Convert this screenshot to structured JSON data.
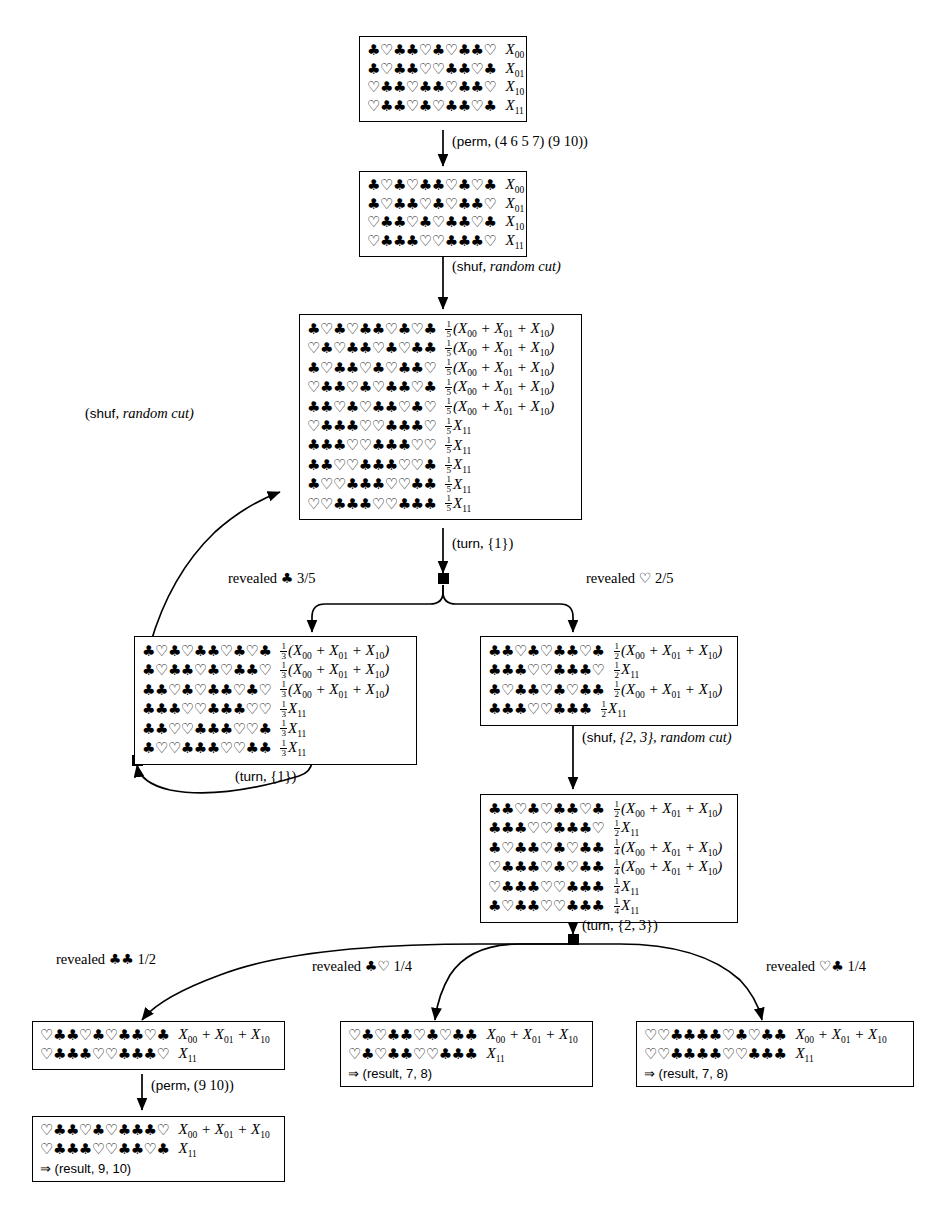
{
  "diagram": {
    "suits": {
      "club": "♣",
      "heart": "♡"
    }
  },
  "boxes": [
    {
      "id": "box1",
      "name": "initial-sequence-box",
      "rows": [
        {
          "cards": "♣♡♣♣♡♣♡♣♣♡",
          "frac": null,
          "label": "X",
          "sub": "00",
          "expr": null
        },
        {
          "cards": "♣♡♣♣♡♡♣♣♡♣",
          "frac": null,
          "label": "X",
          "sub": "01",
          "expr": null
        },
        {
          "cards": "♡♣♣♡♣♣♡♣♣♡",
          "frac": null,
          "label": "X",
          "sub": "10",
          "expr": null
        },
        {
          "cards": "♡♣♣♡♣♡♣♣♡♣",
          "frac": null,
          "label": "X",
          "sub": "11",
          "expr": null
        }
      ]
    },
    {
      "id": "box2",
      "name": "after-perm-box",
      "rows": [
        {
          "cards": "♣♡♣♡♣♣♡♣♡♣",
          "frac": null,
          "label": "X",
          "sub": "00",
          "expr": null
        },
        {
          "cards": "♣♡♣♣♡♣♡♣♣♡",
          "frac": null,
          "label": "X",
          "sub": "01",
          "expr": null
        },
        {
          "cards": "♡♣♣♡♣♡♣♣♡♣",
          "frac": null,
          "label": "X",
          "sub": "10",
          "expr": null
        },
        {
          "cards": "♡♣♣♣♡♡♣♣♣♡",
          "frac": null,
          "label": "X",
          "sub": "11",
          "expr": null
        }
      ]
    },
    {
      "id": "box3",
      "name": "after-shuffle-box",
      "rows": [
        {
          "cards": "♣♡♣♡♣♣♡♣♡♣",
          "frac": "1/5",
          "label": null,
          "sub": null,
          "expr": "(X00 + X01 + X10)"
        },
        {
          "cards": "♡♣♡♣♣♡♣♡♣♣",
          "frac": "1/5",
          "label": null,
          "sub": null,
          "expr": "(X00 + X01 + X10)"
        },
        {
          "cards": "♣♡♣♣♡♣♡♣♣♡",
          "frac": "1/5",
          "label": null,
          "sub": null,
          "expr": "(X00 + X01 + X10)"
        },
        {
          "cards": "♡♣♣♡♣♡♣♣♡♣",
          "frac": "1/5",
          "label": null,
          "sub": null,
          "expr": "(X00 + X01 + X10)"
        },
        {
          "cards": "♣♣♡♣♡♣♣♡♣♡",
          "frac": "1/5",
          "label": null,
          "sub": null,
          "expr": "(X00 + X01 + X10)"
        },
        {
          "cards": "♡♣♣♣♡♡♣♣♣♡",
          "frac": "1/5",
          "label": "X",
          "sub": "11",
          "expr": null
        },
        {
          "cards": "♣♣♣♡♡♣♣♣♡♡",
          "frac": "1/5",
          "label": "X",
          "sub": "11",
          "expr": null
        },
        {
          "cards": "♣♣♡♡♣♣♣♡♡♣",
          "frac": "1/5",
          "label": "X",
          "sub": "11",
          "expr": null
        },
        {
          "cards": "♣♡♡♣♣♣♡♡♣♣",
          "frac": "1/5",
          "label": "X",
          "sub": "11",
          "expr": null
        },
        {
          "cards": "♡♡♣♣♣♡♡♣♣♣",
          "frac": "1/5",
          "label": "X",
          "sub": "11",
          "expr": null
        }
      ]
    },
    {
      "id": "box4",
      "name": "revealed-club-branch-box",
      "rows": [
        {
          "cards": "♣♡♣♡♣♣♡♣♡♣",
          "frac": "1/3",
          "label": null,
          "sub": null,
          "expr": "(X00 + X01 + X10)"
        },
        {
          "cards": "♣♡♣♣♡♣♡♣♣♡",
          "frac": "1/3",
          "label": null,
          "sub": null,
          "expr": "(X00 + X01 + X10)"
        },
        {
          "cards": "♣♣♡♣♡♣♣♡♣♡",
          "frac": "1/3",
          "label": null,
          "sub": null,
          "expr": "(X00 + X01 + X10)"
        },
        {
          "cards": "♣♣♣♡♡♣♣♣♡♡",
          "frac": "1/3",
          "label": "X",
          "sub": "11",
          "expr": null
        },
        {
          "cards": "♣♣♡♡♣♣♣♡♡♣",
          "frac": "1/3",
          "label": "X",
          "sub": "11",
          "expr": null
        },
        {
          "cards": "♣♡♡♣♣♣♡♡♣♣",
          "frac": "1/3",
          "label": "X",
          "sub": "11",
          "expr": null
        }
      ]
    },
    {
      "id": "box5",
      "name": "revealed-heart-branch-box",
      "rows": [
        {
          "cards": "♣♣♡♣♡♣♣♡♣",
          "frac": "1/2",
          "label": null,
          "sub": null,
          "expr": "(X00 + X01 + X10)"
        },
        {
          "cards": "♣♣♣♡♡♣♣♣♡",
          "frac": "1/2",
          "label": "X",
          "sub": "11",
          "expr": null
        },
        {
          "cards": "♣♡♣♣♡♣♡♣♣",
          "frac": "1/2",
          "label": null,
          "sub": null,
          "expr": "(X00 + X01 + X10)"
        },
        {
          "cards": "♣♣♣♡♡♣♣♣",
          "frac": "1/2",
          "label": "X",
          "sub": "11",
          "expr": null
        }
      ]
    },
    {
      "id": "box6",
      "name": "after-second-shuffle-box",
      "rows": [
        {
          "cards": "♣♣♡♣♡♣♣♡♣",
          "frac": "1/2",
          "label": null,
          "sub": null,
          "expr": "(X00 + X01 + X10)"
        },
        {
          "cards": "♣♣♣♡♡♣♣♣♡",
          "frac": "1/2",
          "label": "X",
          "sub": "11",
          "expr": null
        },
        {
          "cards": "♣♡♣♣♡♣♡♣♣",
          "frac": "1/4",
          "label": null,
          "sub": null,
          "expr": "(X00 + X01 + X10)"
        },
        {
          "cards": "♡♣♣♣♡♣♡♣♣",
          "frac": "1/4",
          "label": null,
          "sub": null,
          "expr": "(X00 + X01 + X10)"
        },
        {
          "cards": "♡♣♣♣♡♡♣♣♣",
          "frac": "1/4",
          "label": "X",
          "sub": "11",
          "expr": null
        },
        {
          "cards": "♣♡♣♣♡♡♣♣♣",
          "frac": "1/4",
          "label": "X",
          "sub": "11",
          "expr": null
        }
      ]
    },
    {
      "id": "box7",
      "name": "club-club-outcome-box",
      "rows": [
        {
          "cards": "♡♣♣♡♣♡♣♣♡♣",
          "frac": null,
          "label": null,
          "sub": null,
          "expr": "X00 + X01 + X10"
        },
        {
          "cards": "♡♣♣♣♡♡♣♣♣♡",
          "frac": null,
          "label": "X",
          "sub": "11",
          "expr": null
        }
      ],
      "result": null
    },
    {
      "id": "box8",
      "name": "final-result-box",
      "rows": [
        {
          "cards": "♡♣♣♡♣♡♣♣♣♡",
          "frac": null,
          "label": null,
          "sub": null,
          "expr": "X00 + X01 + X10"
        },
        {
          "cards": "♡♣♣♣♡♡♣♣♡♣",
          "frac": null,
          "label": "X",
          "sub": "11",
          "expr": null
        }
      ],
      "result": "⇒ (result, 9, 10)"
    },
    {
      "id": "box9",
      "name": "club-heart-outcome-box",
      "rows": [
        {
          "cards": "♡♣♡♣♣♡♣♡♣♣",
          "frac": null,
          "label": null,
          "sub": null,
          "expr": "X00 + X01 + X10"
        },
        {
          "cards": "♡♣♡♣♣♡♡♣♣♣",
          "frac": null,
          "label": "X",
          "sub": "11",
          "expr": null
        }
      ],
      "result": "⇒ (result, 7, 8)"
    },
    {
      "id": "box10",
      "name": "heart-club-outcome-box",
      "rows": [
        {
          "cards": "♡♡♣♣♣♣♡♣♡♣♣",
          "frac": null,
          "label": null,
          "sub": null,
          "expr": "X00 + X01 + X10"
        },
        {
          "cards": "♡♡♣♣♣♣♡♡♣♣♣",
          "frac": null,
          "label": "X",
          "sub": "11",
          "expr": null
        }
      ],
      "result": "⇒ (result, 7, 8)"
    }
  ],
  "edge_labels": {
    "perm_1": {
      "op": "perm",
      "arg": ", (4 6 5 7) (9 10))",
      "full": "(perm, (4 6 5 7) (9 10))"
    },
    "shuf_1": {
      "op": "shuf",
      "arg": ", random cut)",
      "full": "(shuf, random cut)"
    },
    "turn_1": {
      "op": "turn",
      "arg": ", {1})",
      "full": "(turn, {1})"
    },
    "shuf_left": {
      "op": "shuf",
      "arg": ", random cut)",
      "full": "(shuf, random cut)"
    },
    "turn_left": {
      "op": "turn",
      "arg": ", {1})",
      "full": "(turn, {1})"
    },
    "shuf_right": {
      "op": "shuf",
      "arg": ", {2, 3}, random cut)",
      "full": "(shuf, {2, 3}, random cut)"
    },
    "turn_right": {
      "op": "turn",
      "arg": ", {2, 3})",
      "full": "(turn, {2, 3})"
    },
    "perm_final": {
      "op": "perm",
      "arg": ", (9 10))",
      "full": "(perm, (9 10))"
    }
  },
  "revealed_labels": {
    "r1": {
      "text": "revealed",
      "suit": "♣",
      "prob": "3/5"
    },
    "r2": {
      "text": "revealed",
      "suit": "♡",
      "prob": "2/5"
    },
    "r3": {
      "text": "revealed",
      "suit": "♣♣",
      "prob": "1/2"
    },
    "r4": {
      "text": "revealed",
      "suit": "♣♡",
      "prob": "1/4"
    },
    "r5": {
      "text": "revealed",
      "suit": "♡♣",
      "prob": "1/4"
    }
  }
}
